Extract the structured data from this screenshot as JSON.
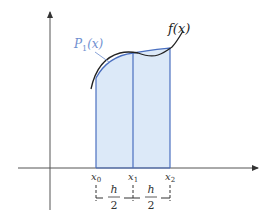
{
  "diagram": {
    "curve_label": "f(x)",
    "poly_label_base": "P",
    "poly_label_sub": "1",
    "poly_label_arg": "(x)",
    "nodes": [
      {
        "name": "x",
        "sub": "0"
      },
      {
        "name": "x",
        "sub": "1"
      },
      {
        "name": "x",
        "sub": "2"
      }
    ],
    "step_numerator": "h",
    "step_denominator": "2",
    "colors": {
      "axis": "#555555",
      "curve": "#222222",
      "poly": "#4a6fc0",
      "fill": "#dce9f8",
      "poly_label": "#6f8fcf"
    }
  }
}
